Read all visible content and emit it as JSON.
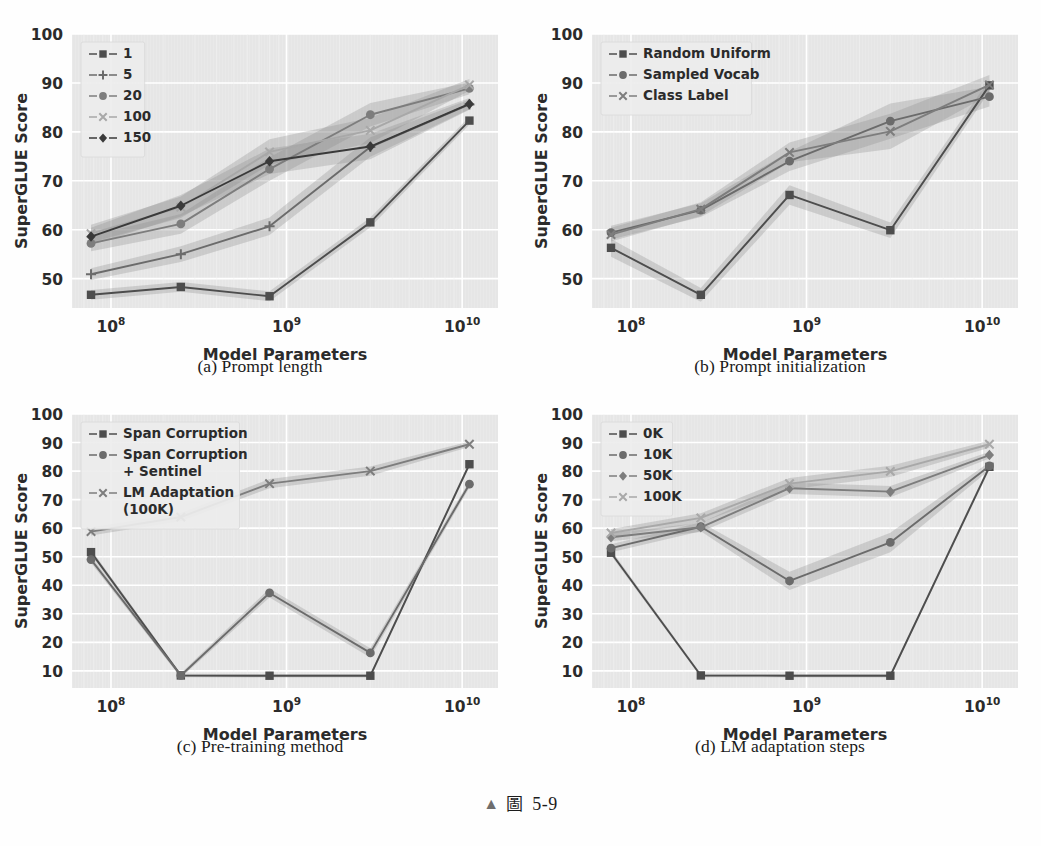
{
  "figure": {
    "caption_marker": "▲",
    "caption_label": "圖",
    "caption_number": "5-9"
  },
  "axis": {
    "xlabel": "Model Parameters",
    "ylabel": "SuperGLUE Score",
    "xticks": [
      "10⁸",
      "10⁹",
      "10¹⁰"
    ],
    "xtick_values": [
      100000000,
      1000000000,
      10000000000
    ],
    "yticks_a": [
      "50",
      "60",
      "70",
      "80",
      "90",
      "100"
    ],
    "yticks_c": [
      "10",
      "20",
      "30",
      "40",
      "50",
      "60",
      "70",
      "80",
      "90",
      "100"
    ]
  },
  "style": {
    "plot_bg": "#e6e6e6",
    "grid_color": "#ffffff",
    "text_color": "#2b2b2b",
    "band_color": "#8c8c8c",
    "series_colors": [
      "#4d4d4d",
      "#6b6b6b",
      "#7d7d7d",
      "#a8a8a8",
      "#3a3a3a"
    ]
  },
  "panels": [
    {
      "key": "a",
      "caption": "(a) Prompt length"
    },
    {
      "key": "b",
      "caption": "(b) Prompt initialization"
    },
    {
      "key": "c",
      "caption": "(c) Pre-training method"
    },
    {
      "key": "d",
      "caption": "(d) LM adaptation steps"
    }
  ],
  "chart_data": [
    {
      "type": "line",
      "panel": "a",
      "title": "(a) Prompt length",
      "xlabel": "Model Parameters",
      "ylabel": "SuperGLUE Score",
      "xscale": "log",
      "xlim": [
        60000000,
        16000000000
      ],
      "ylim": [
        44,
        100
      ],
      "ytick_step": 10,
      "grid": true,
      "legend_position": "upper left",
      "x": [
        77000000,
        250000000,
        800000000,
        3000000000,
        11000000000
      ],
      "xtick_labels": [
        "10⁸",
        "10⁹",
        "10¹⁰"
      ],
      "series": [
        {
          "name": "1",
          "marker": "square",
          "values": [
            46.7,
            48.3,
            46.4,
            61.5,
            82.3
          ],
          "band": [
            1.0,
            1.0,
            1.0,
            1.0,
            0.8
          ]
        },
        {
          "name": "5",
          "marker": "plus",
          "values": [
            50.9,
            55.0,
            60.7,
            76.9,
            85.6
          ],
          "band": [
            1.2,
            1.6,
            1.8,
            2.0,
            1.0
          ]
        },
        {
          "name": "20",
          "marker": "circle",
          "values": [
            57.2,
            61.2,
            72.4,
            83.5,
            88.9
          ],
          "band": [
            1.6,
            2.0,
            2.4,
            2.4,
            1.2
          ]
        },
        {
          "name": "100",
          "marker": "x",
          "values": [
            59.2,
            64.6,
            75.9,
            80.3,
            89.6
          ],
          "band": [
            1.8,
            2.2,
            2.6,
            2.6,
            1.2
          ]
        },
        {
          "name": "150",
          "marker": "diamond",
          "values": [
            58.6,
            64.9,
            74.0,
            77.0,
            85.7
          ],
          "band": [
            1.8,
            2.2,
            2.6,
            2.6,
            1.2
          ]
        }
      ]
    },
    {
      "type": "line",
      "panel": "b",
      "title": "(b) Prompt initialization",
      "xlabel": "Model Parameters",
      "ylabel": "SuperGLUE Score",
      "xscale": "log",
      "xlim": [
        60000000,
        16000000000
      ],
      "ylim": [
        44,
        100
      ],
      "ytick_step": 10,
      "grid": true,
      "legend_position": "upper left",
      "x": [
        77000000,
        250000000,
        800000000,
        3000000000,
        11000000000
      ],
      "xtick_labels": [
        "10⁸",
        "10⁹",
        "10¹⁰"
      ],
      "series": [
        {
          "name": "Random Uniform",
          "marker": "square",
          "values": [
            56.3,
            46.7,
            67.1,
            59.9,
            89.5
          ],
          "band": [
            1.8,
            1.4,
            2.0,
            1.6,
            1.2
          ]
        },
        {
          "name": "Sampled Vocab",
          "marker": "circle",
          "values": [
            59.4,
            64.0,
            74.0,
            82.2,
            87.2
          ],
          "band": [
            1.4,
            1.4,
            2.0,
            3.6,
            2.0
          ]
        },
        {
          "name": "Class Label",
          "marker": "x",
          "values": [
            59.0,
            64.2,
            75.8,
            80.1,
            89.6
          ],
          "band": [
            1.4,
            1.4,
            2.0,
            3.6,
            2.0
          ]
        }
      ]
    },
    {
      "type": "line",
      "panel": "c",
      "title": "(c) Pre-training method",
      "xlabel": "Model Parameters",
      "ylabel": "SuperGLUE Score",
      "xscale": "log",
      "xlim": [
        60000000,
        16000000000
      ],
      "ylim": [
        4,
        100
      ],
      "ytick_step": 10,
      "grid": true,
      "legend_position": "upper left",
      "x": [
        77000000,
        250000000,
        800000000,
        3000000000,
        11000000000
      ],
      "xtick_labels": [
        "10⁸",
        "10⁹",
        "10¹⁰"
      ],
      "series": [
        {
          "name": "Span Corruption",
          "marker": "square",
          "values": [
            51.6,
            8.4,
            8.3,
            8.3,
            82.4
          ],
          "band": [
            1.0,
            0.6,
            0.6,
            0.6,
            0.8
          ]
        },
        {
          "name": "Span Corruption\n+ Sentinel",
          "marker": "circle",
          "values": [
            49.0,
            8.4,
            37.3,
            16.3,
            75.4
          ],
          "band": [
            1.2,
            0.8,
            1.6,
            1.6,
            1.2
          ]
        },
        {
          "name": "LM Adaptation\n(100K)",
          "marker": "x",
          "values": [
            58.8,
            63.9,
            75.6,
            80.0,
            89.4
          ],
          "band": [
            1.4,
            1.4,
            1.6,
            1.6,
            1.0
          ]
        }
      ]
    },
    {
      "type": "line",
      "panel": "d",
      "title": "(d) LM adaptation steps",
      "xlabel": "Model Parameters",
      "ylabel": "SuperGLUE Score",
      "xscale": "log",
      "xlim": [
        60000000,
        16000000000
      ],
      "ylim": [
        4,
        100
      ],
      "ytick_step": 10,
      "grid": true,
      "legend_position": "upper left",
      "x": [
        77000000,
        250000000,
        800000000,
        3000000000,
        11000000000
      ],
      "xtick_labels": [
        "10⁸",
        "10⁹",
        "10¹⁰"
      ],
      "series": [
        {
          "name": "0K",
          "marker": "square",
          "values": [
            51.4,
            8.4,
            8.3,
            8.3,
            81.5
          ],
          "band": [
            1.0,
            0.6,
            0.6,
            0.6,
            1.0
          ]
        },
        {
          "name": "10K",
          "marker": "circle",
          "values": [
            53.0,
            60.5,
            41.5,
            55.0,
            81.8
          ],
          "band": [
            1.4,
            1.6,
            3.2,
            3.4,
            1.4
          ]
        },
        {
          "name": "50K",
          "marker": "diamond",
          "values": [
            56.8,
            60.3,
            74.0,
            72.8,
            85.6
          ],
          "band": [
            1.4,
            1.6,
            2.0,
            2.0,
            1.2
          ]
        },
        {
          "name": "100K",
          "marker": "x",
          "values": [
            58.3,
            63.6,
            75.6,
            79.9,
            89.4
          ],
          "band": [
            1.4,
            1.6,
            2.0,
            2.0,
            1.2
          ]
        }
      ]
    }
  ]
}
